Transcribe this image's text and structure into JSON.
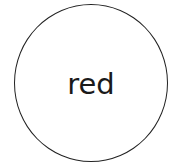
{
  "node": {
    "label": "red",
    "shape": "circle",
    "border_color": "#222222",
    "fill_color": "#ffffff"
  }
}
